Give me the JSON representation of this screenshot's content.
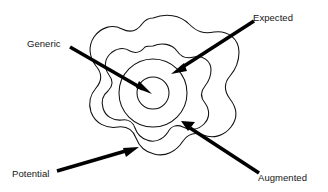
{
  "diagram": {
    "type": "concentric-levels",
    "background_color": "#ffffff",
    "stroke_color": "#111111",
    "arrow_color": "#000000",
    "center": {
      "x": 153,
      "y": 93
    },
    "levels": [
      {
        "id": "generic",
        "label": "Generic",
        "shape": "circle",
        "order": 1,
        "radius": 16,
        "description": "innermost core circle"
      },
      {
        "id": "expected",
        "label": "Expected",
        "shape": "circle",
        "order": 2,
        "radius": 34,
        "description": "second concentric circle"
      },
      {
        "id": "augmented",
        "label": "Augmented",
        "shape": "wavy-blob",
        "order": 3,
        "lobes": 6,
        "radius_mean": 47,
        "radius_amplitude": 7,
        "description": "middle scalloped blob"
      },
      {
        "id": "potential",
        "label": "Potential",
        "shape": "wavy-blob",
        "order": 4,
        "lobes": 6,
        "radius_mean": 75,
        "radius_amplitude": 11,
        "description": "outer scalloped blob"
      }
    ],
    "callouts": [
      {
        "id": "generic",
        "label": "Generic",
        "label_x": 27,
        "label_y": 38,
        "arrow_from": {
          "x": 70,
          "y": 47
        },
        "arrow_to": {
          "x": 152,
          "y": 94
        }
      },
      {
        "id": "expected",
        "label": "Expected",
        "label_x": 253,
        "label_y": 12,
        "arrow_from": {
          "x": 254,
          "y": 21
        },
        "arrow_to": {
          "x": 171,
          "y": 74
        }
      },
      {
        "id": "potential",
        "label": "Potential",
        "label_x": 12,
        "label_y": 168,
        "arrow_from": {
          "x": 57,
          "y": 171
        },
        "arrow_to": {
          "x": 139,
          "y": 147
        }
      },
      {
        "id": "augmented",
        "label": "Augmented",
        "label_x": 258,
        "label_y": 172,
        "arrow_from": {
          "x": 259,
          "y": 173
        },
        "arrow_to": {
          "x": 181,
          "y": 121
        }
      }
    ]
  }
}
